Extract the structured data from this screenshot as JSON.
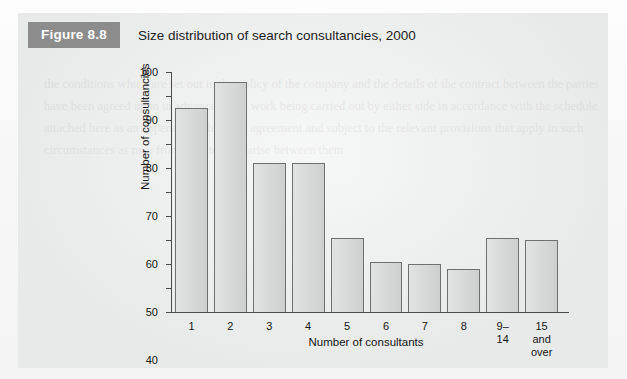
{
  "figure": {
    "badge_label": "Figure 8.8",
    "title": "Size distribution of search consultancies, 2000"
  },
  "colors": {
    "badge_bg": "#8c8c8c",
    "badge_text": "#ffffff",
    "panel_bg": "#eceded",
    "bar_fill": "#d2d3d3",
    "bar_border": "#6f7070",
    "axis": "#4c4c4c",
    "text": "#171717"
  },
  "chart_data": {
    "type": "bar",
    "title": "Size distribution of search consultancies, 2000",
    "xlabel": "Number of consultants",
    "ylabel": "Number of consultancies",
    "categories": [
      "1",
      "2",
      "3",
      "4",
      "5",
      "6",
      "7",
      "8",
      "9–14",
      "15 and\nover"
    ],
    "values": [
      85,
      96,
      62,
      62,
      31,
      21,
      20,
      18,
      31,
      30
    ],
    "ylim": [
      0,
      100
    ],
    "yticks": [
      0,
      10,
      20,
      30,
      40,
      50,
      60,
      70,
      80,
      90,
      100
    ],
    "ytick_labels": [
      "0",
      "10",
      "20",
      "30",
      "40",
      "50",
      "60",
      "70",
      "80",
      "90",
      "100"
    ],
    "grid": false,
    "legend": false
  }
}
